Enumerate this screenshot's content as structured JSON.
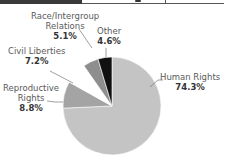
{
  "header": {
    "fragment": ""
  },
  "chart_data": {
    "type": "pie",
    "title": "",
    "categories": [
      "Human Rights",
      "Reproductive Rights",
      "Civil Liberties",
      "Race/Intergroup Relations",
      "Other"
    ],
    "values": [
      74.3,
      8.8,
      7.2,
      5.1,
      4.6
    ],
    "unit": "%",
    "colors": [
      "#c4c4c4",
      "#a4a4a4",
      "#ffffff",
      "#8e8e8e",
      "#111111"
    ],
    "labels": [
      {
        "name_lines": [
          "Human Rights"
        ],
        "value": "74.3%"
      },
      {
        "name_lines": [
          "Reproductive",
          "Rights"
        ],
        "value": "8.8%"
      },
      {
        "name_lines": [
          "Civil Liberties"
        ],
        "value": "7.2%"
      },
      {
        "name_lines": [
          "Race/Intergroup",
          "Relations"
        ],
        "value": "5.1%"
      },
      {
        "name_lines": [
          "Other"
        ],
        "value": "4.6%"
      }
    ],
    "legend": "none (direct labels with leader lines)"
  }
}
